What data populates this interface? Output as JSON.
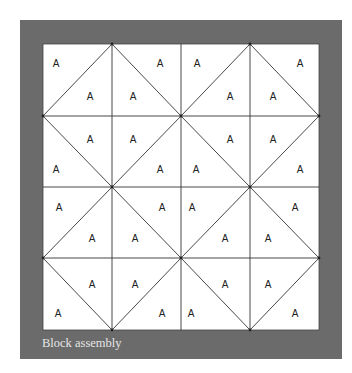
{
  "figure": {
    "caption": "Block assembly",
    "colors": {
      "frame": "#6b6b6b",
      "panel": "#ffffff",
      "lines": "#333333",
      "caption_text": "#e6e6e6"
    },
    "frame": {
      "x": 20,
      "y": 20,
      "w": 322,
      "h": 339
    },
    "grid": {
      "x0": 43,
      "y0": 44,
      "col_edges": [
        43,
        112,
        181,
        250,
        319
      ],
      "row_edges": [
        44,
        116,
        187,
        258,
        330
      ],
      "rows": 4,
      "cols": 4
    },
    "cells": [
      [
        {
          "diag": "/",
          "labels": [
            {
              "t": "A",
              "x": 56,
              "y": 64
            },
            {
              "t": "A",
              "x": 90,
              "y": 97
            }
          ]
        },
        {
          "diag": "\\",
          "labels": [
            {
              "t": "A",
              "x": 133,
              "y": 97
            },
            {
              "t": "A",
              "x": 160,
              "y": 64
            }
          ]
        },
        {
          "diag": "/",
          "labels": [
            {
              "t": "A",
              "x": 197,
              "y": 64
            },
            {
              "t": "A",
              "x": 230,
              "y": 97
            }
          ]
        },
        {
          "diag": "\\",
          "labels": [
            {
              "t": "A",
              "x": 273,
              "y": 97
            },
            {
              "t": "A",
              "x": 300,
              "y": 64
            }
          ]
        }
      ],
      [
        {
          "diag": "\\",
          "labels": [
            {
              "t": "A",
              "x": 90,
              "y": 140
            },
            {
              "t": "A",
              "x": 56,
              "y": 170
            }
          ]
        },
        {
          "diag": "/",
          "labels": [
            {
              "t": "A",
              "x": 133,
              "y": 140
            },
            {
              "t": "A",
              "x": 160,
              "y": 170
            }
          ]
        },
        {
          "diag": "\\",
          "labels": [
            {
              "t": "A",
              "x": 230,
              "y": 140
            },
            {
              "t": "A",
              "x": 196,
              "y": 170
            }
          ]
        },
        {
          "diag": "/",
          "labels": [
            {
              "t": "A",
              "x": 273,
              "y": 140
            },
            {
              "t": "A",
              "x": 300,
              "y": 170
            }
          ]
        }
      ],
      [
        {
          "diag": "/",
          "labels": [
            {
              "t": "A",
              "x": 59,
              "y": 208
            },
            {
              "t": "A",
              "x": 92,
              "y": 239
            }
          ]
        },
        {
          "diag": "\\",
          "labels": [
            {
              "t": "A",
              "x": 162,
              "y": 208
            },
            {
              "t": "A",
              "x": 135,
              "y": 239
            }
          ]
        },
        {
          "diag": "/",
          "labels": [
            {
              "t": "A",
              "x": 192,
              "y": 208
            },
            {
              "t": "A",
              "x": 225,
              "y": 239
            }
          ]
        },
        {
          "diag": "\\",
          "labels": [
            {
              "t": "A",
              "x": 295,
              "y": 208
            },
            {
              "t": "A",
              "x": 268,
              "y": 239
            }
          ]
        }
      ],
      [
        {
          "diag": "\\",
          "labels": [
            {
              "t": "A",
              "x": 92,
              "y": 285
            },
            {
              "t": "A",
              "x": 58,
              "y": 314
            }
          ]
        },
        {
          "diag": "/",
          "labels": [
            {
              "t": "A",
              "x": 135,
              "y": 285
            },
            {
              "t": "A",
              "x": 162,
              "y": 314
            }
          ]
        },
        {
          "diag": "\\",
          "labels": [
            {
              "t": "A",
              "x": 225,
              "y": 285
            },
            {
              "t": "A",
              "x": 191,
              "y": 314
            }
          ]
        },
        {
          "diag": "/",
          "labels": [
            {
              "t": "A",
              "x": 268,
              "y": 285
            },
            {
              "t": "A",
              "x": 295,
              "y": 314
            }
          ]
        }
      ]
    ]
  }
}
